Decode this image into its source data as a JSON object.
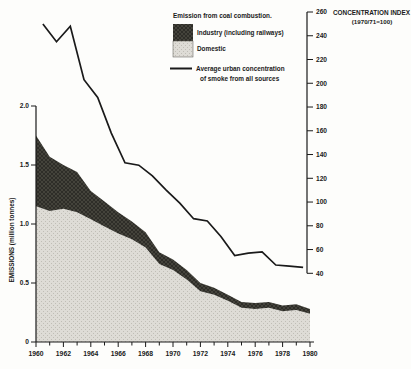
{
  "legend": {
    "title": "Emission from coal combustion.",
    "industry_label": "Industry (including railways)",
    "domestic_label": "Domestic",
    "line_label_1": "Average urban concentration",
    "line_label_2": "of smoke from all sources"
  },
  "colors": {
    "industry": "#2e2d28",
    "industry_hatch": "#4e4c43",
    "domestic": "#dedcd6",
    "domestic_dot": "#c0beb6",
    "line": "#1a1a1a",
    "axis": "#1a1a1a",
    "background": "#fdfdfb"
  },
  "chart_data": {
    "type": "area",
    "title": "Emission from coal combustion.",
    "left_axis": {
      "title": "EMISSIONS (million tonnes)",
      "ticks": [
        {
          "v": 2.0,
          "label": "2.0"
        },
        {
          "v": 1.5,
          "label": "1.5"
        },
        {
          "v": 1.0,
          "label": "1.0"
        },
        {
          "v": 0.5,
          "label": "0.5"
        },
        {
          "v": 0,
          "label": "0"
        }
      ],
      "ylim": [
        0,
        2.0
      ]
    },
    "right_axis": {
      "title": "CONCENTRATION INDEX",
      "subtitle": "(1970/71=100)",
      "ticks": [
        260,
        240,
        220,
        200,
        180,
        160,
        140,
        120,
        100,
        80,
        60,
        40
      ],
      "ylim": [
        40,
        260
      ]
    },
    "x_axis": {
      "xlim": [
        1960,
        1980
      ],
      "minor_tick_step": 1,
      "label_years": [
        "1960",
        "1962",
        "1964",
        "1966",
        "1968",
        "1970",
        "1972",
        "1974",
        "1976",
        "1978",
        "1980"
      ]
    },
    "years": [
      1960,
      1961,
      1962,
      1963,
      1964,
      1965,
      1966,
      1967,
      1968,
      1969,
      1970,
      1971,
      1972,
      1973,
      1974,
      1975,
      1976,
      1977,
      1978,
      1979,
      1980
    ],
    "series": [
      {
        "name": "Domestic",
        "type": "area",
        "axis": "left",
        "values": [
          1.15,
          1.11,
          1.13,
          1.1,
          1.04,
          0.98,
          0.92,
          0.87,
          0.8,
          0.66,
          0.61,
          0.53,
          0.43,
          0.4,
          0.35,
          0.29,
          0.28,
          0.29,
          0.26,
          0.27,
          0.24
        ]
      },
      {
        "name": "Industry (including railways)",
        "type": "area",
        "axis": "left",
        "stacked_on": "Domestic",
        "values": [
          0.6,
          0.46,
          0.37,
          0.34,
          0.24,
          0.21,
          0.18,
          0.15,
          0.13,
          0.1,
          0.09,
          0.08,
          0.07,
          0.06,
          0.05,
          0.05,
          0.05,
          0.05,
          0.05,
          0.05,
          0.04
        ]
      },
      {
        "name": "Average urban concentration of smoke from all sources",
        "type": "line",
        "axis": "right",
        "x": [
          1960.5,
          1961.5,
          1962.5,
          1963.5,
          1964.5,
          1965.5,
          1966.5,
          1967.5,
          1968.5,
          1969.5,
          1970.5,
          1971.5,
          1972.5,
          1973.5,
          1974.5,
          1975.5,
          1976.5,
          1977.5,
          1978.5,
          1979.5
        ],
        "values": [
          250,
          235,
          248,
          203,
          188,
          158,
          133,
          131,
          122,
          110,
          99,
          86,
          84,
          71,
          55,
          57,
          58,
          47,
          46,
          45
        ]
      }
    ]
  }
}
